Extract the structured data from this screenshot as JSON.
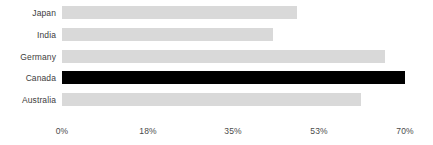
{
  "chart_data": {
    "type": "bar",
    "orientation": "horizontal",
    "title": "",
    "subtitle": "",
    "xlabel": "",
    "ylabel": "",
    "categories": [
      "Japan",
      "India",
      "Germany",
      "Canada",
      "Australia"
    ],
    "values": [
      48,
      43,
      66,
      70,
      61
    ],
    "value_suffix": "%",
    "xlim": [
      0,
      70
    ],
    "xticks": [
      0,
      18,
      35,
      53,
      70
    ],
    "xtick_labels": [
      "0%",
      "18%",
      "35%",
      "53%",
      "70%"
    ],
    "grid": false,
    "legend": false,
    "highlighted_category": "Canada",
    "colors": {
      "bar": "#d9d9d9",
      "bar_highlight": "#000000",
      "label_text": "#3d3d3d",
      "tick_text": "#4a4a4a",
      "background": "#ffffff"
    }
  },
  "axis": {
    "ticks": [
      {
        "label": "0%",
        "pos": 62
      },
      {
        "label": "18%",
        "pos": 148
      },
      {
        "label": "35%",
        "pos": 233
      },
      {
        "label": "53%",
        "pos": 319
      },
      {
        "label": "70%",
        "pos": 405
      }
    ]
  },
  "bars": [
    {
      "label": "Japan",
      "value": 48,
      "top": 6,
      "width": 236,
      "highlight": false
    },
    {
      "label": "India",
      "value": 43,
      "top": 28,
      "width": 212,
      "highlight": false
    },
    {
      "label": "Germany",
      "value": 66,
      "top": 50,
      "width": 326,
      "highlight": false
    },
    {
      "label": "Canada",
      "value": 70,
      "top": 71,
      "width": 344,
      "highlight": true
    },
    {
      "label": "Australia",
      "value": 61,
      "top": 93,
      "width": 300,
      "highlight": false
    }
  ]
}
